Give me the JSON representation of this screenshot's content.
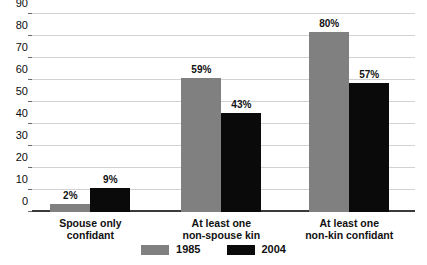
{
  "chart_data": {
    "type": "bar",
    "title": "",
    "subtitle": "",
    "xlabel": "",
    "ylabel": "",
    "ylim": [
      0,
      90
    ],
    "ytick_step": 10,
    "yticks": [
      "90",
      "80",
      "70",
      "60",
      "50",
      "40",
      "30",
      "20",
      "10",
      "0"
    ],
    "grid": true,
    "legend_position": "bottom-center",
    "categories": [
      "Spouse only confidant",
      "At least one non-spouse kin",
      "At least one non-kin confidant"
    ],
    "category_lines": [
      [
        "Spouse only",
        "confidant"
      ],
      [
        "At least one",
        "non-spouse kin"
      ],
      [
        "At least one",
        "non-kin confidant"
      ]
    ],
    "series": [
      {
        "name": "1985",
        "color": "#808080",
        "values": [
          2,
          59,
          80
        ],
        "labels": [
          "2%",
          "59%",
          "80%"
        ]
      },
      {
        "name": "2004",
        "color": "#0a0a0a",
        "values": [
          9,
          43,
          57
        ],
        "labels": [
          "9%",
          "43%",
          "57%"
        ]
      }
    ]
  },
  "legend": {
    "items": [
      {
        "label": "1985",
        "swatch": "legend-swatch-1985"
      },
      {
        "label": "2004",
        "swatch": "legend-swatch-2004"
      }
    ]
  }
}
